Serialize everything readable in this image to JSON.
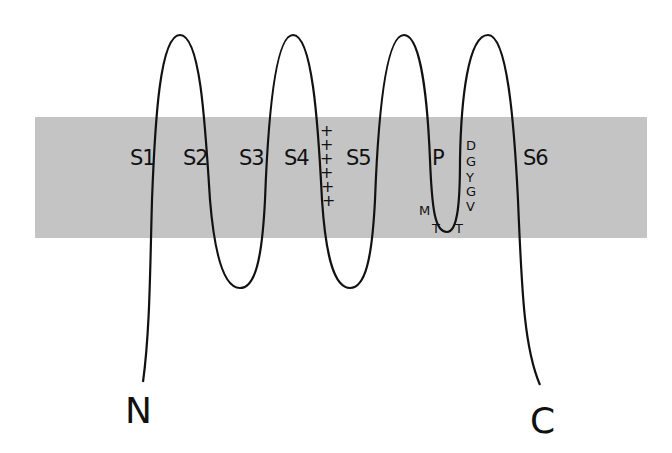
{
  "diagram": {
    "type": "membrane-topology",
    "membrane_color": "#c4c4c4",
    "line_color": "#111111",
    "segments": [
      {
        "id": "S1",
        "label": "S1",
        "x": 132
      },
      {
        "id": "S2",
        "label": "S2",
        "x": 183
      },
      {
        "id": "S3",
        "label": "S3",
        "x": 240
      },
      {
        "id": "S4",
        "label": "S4",
        "x": 285
      },
      {
        "id": "S5",
        "label": "S5",
        "x": 347
      },
      {
        "id": "P",
        "label": "P",
        "x": 433
      },
      {
        "id": "S6",
        "label": "S6",
        "x": 523
      }
    ],
    "s4_charges": [
      "+",
      "+",
      "+",
      "+",
      "+",
      "+"
    ],
    "pore_residues": {
      "right_column": [
        "D",
        "G",
        "Y",
        "G",
        "V"
      ],
      "left": "M",
      "bottom": [
        "T",
        "T"
      ]
    },
    "termini": {
      "n": "N",
      "c": "C"
    }
  }
}
